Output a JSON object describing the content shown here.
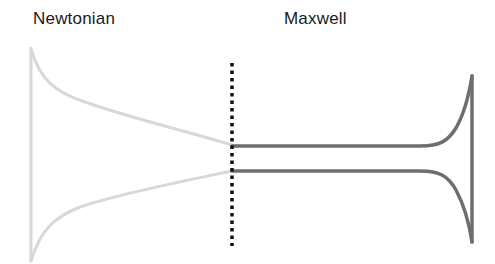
{
  "labels": {
    "left": "Newtonian",
    "right": "Maxwell"
  },
  "colors": {
    "newtonian_curve": "#d8d8d8",
    "maxwell_curve": "#6e6e6e",
    "divider": "#111111",
    "text": "#1a1a1a",
    "background": "#ffffff"
  },
  "divider": {
    "style": "dotted",
    "x": 232
  }
}
